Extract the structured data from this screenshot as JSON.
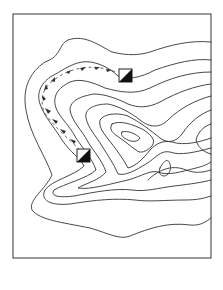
{
  "map": {
    "type": "topographic-contour-map",
    "frame": {
      "x": 13,
      "y": 14,
      "width": 198,
      "height": 244,
      "stroke": "#555555"
    },
    "colors": {
      "contour": "#333333",
      "marker_fill": "#111111",
      "background": "#ffffff"
    },
    "markers": [
      {
        "name": "control-point-upper",
        "x": 119,
        "y": 69,
        "size": 13,
        "style": "half-filled-square"
      },
      {
        "name": "control-point-lower",
        "x": 77,
        "y": 149,
        "size": 13,
        "style": "half-filled-square"
      }
    ],
    "route": {
      "description": "arrow trail from lower marker up the left flank and across to upper marker",
      "arrow_count": 12
    },
    "contour_count": 9
  }
}
